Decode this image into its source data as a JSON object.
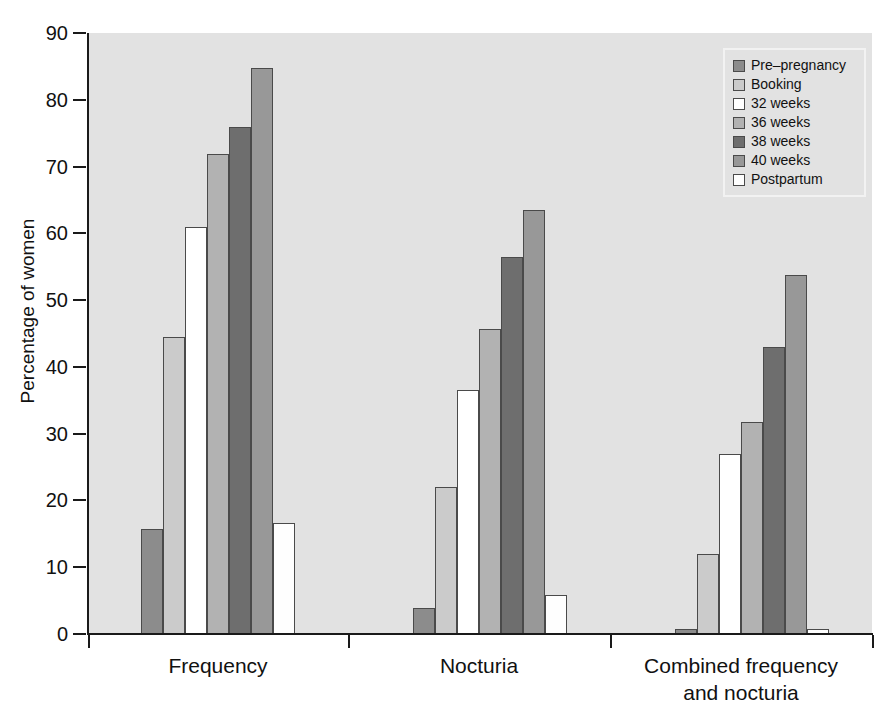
{
  "chart_data": {
    "type": "bar",
    "title": "",
    "xlabel": "",
    "ylabel": "Percentage of women",
    "ylim": [
      0,
      90
    ],
    "yticks": [
      0,
      10,
      20,
      30,
      40,
      50,
      60,
      70,
      80,
      90
    ],
    "grid": false,
    "legend_position": "top-right",
    "categories": [
      "Frequency",
      "Nocturia",
      "Combined frequency and nocturia"
    ],
    "category_lines": [
      [
        "Frequency"
      ],
      [
        "Nocturia"
      ],
      [
        "Combined frequency",
        "and nocturia"
      ]
    ],
    "series": [
      {
        "name": "Pre–pregnancy",
        "color": "#8c8c8c",
        "values": [
          15.8,
          3.9,
          0.8
        ]
      },
      {
        "name": "Booking",
        "color": "#cbcbcb",
        "values": [
          44.5,
          22.0,
          12.0
        ]
      },
      {
        "name": "32 weeks",
        "color": "#ffffff",
        "values": [
          60.9,
          36.6,
          26.9
        ]
      },
      {
        "name": "36 weeks",
        "color": "#b2b2b2",
        "values": [
          71.9,
          45.7,
          31.8
        ]
      },
      {
        "name": "38 weeks",
        "color": "#6e6e6e",
        "values": [
          76.0,
          56.5,
          43.0
        ]
      },
      {
        "name": "40 weeks",
        "color": "#989898",
        "values": [
          84.8,
          63.5,
          53.8
        ]
      },
      {
        "name": "Postpartum",
        "color": "#fefefe",
        "values": [
          16.6,
          5.8,
          0.8
        ]
      }
    ]
  },
  "legend": {
    "items": [
      {
        "label": "Pre–pregnancy",
        "swatch": "legend-swatch-pre-pregnancy"
      },
      {
        "label": "Booking",
        "swatch": "legend-swatch-booking"
      },
      {
        "label": "32 weeks",
        "swatch": "legend-swatch-32-weeks"
      },
      {
        "label": "36 weeks",
        "swatch": "legend-swatch-36-weeks"
      },
      {
        "label": "38 weeks",
        "swatch": "legend-swatch-38-weeks"
      },
      {
        "label": "40 weeks",
        "swatch": "legend-swatch-40-weeks"
      },
      {
        "label": "Postpartum",
        "swatch": "legend-swatch-postpartum"
      }
    ]
  },
  "colors": {
    "plot_background": "#e2e2e2",
    "page_background": "#ffffff",
    "axis": "#1a1a1a",
    "bar_outline": "#4a4a4a",
    "legend_border": "#f2f2f2"
  }
}
